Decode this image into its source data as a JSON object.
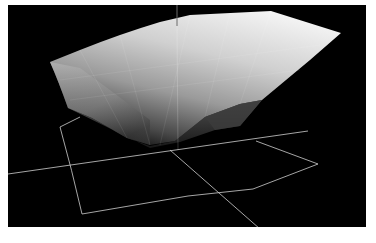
{
  "scene": {
    "label": "3D surface render",
    "background_color": "#000000",
    "frame_color": "#ffffff",
    "axis_color": "#d8d8d8",
    "surface": {
      "highlight_color": "#f2f2f2",
      "mid_color": "#9a9a9a",
      "shadow_color": "#2a2a2a"
    }
  }
}
